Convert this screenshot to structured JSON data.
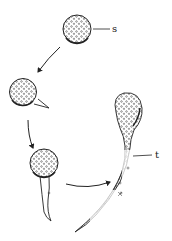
{
  "diagram": {
    "type": "spore germination sequence",
    "stages": [
      {
        "id": "stage-1",
        "description": "spherical spore with granular contents",
        "label": "s"
      },
      {
        "id": "stage-2",
        "description": "spore forming a small germ protrusion"
      },
      {
        "id": "stage-3",
        "description": "spore with short emerging germ tube"
      },
      {
        "id": "stage-4",
        "description": "spore with elongated germ tube",
        "label": "t"
      }
    ],
    "labels": {
      "spore": "s",
      "tube": "t"
    },
    "colors": {
      "ink": "#222222",
      "background": "#ffffff"
    }
  }
}
